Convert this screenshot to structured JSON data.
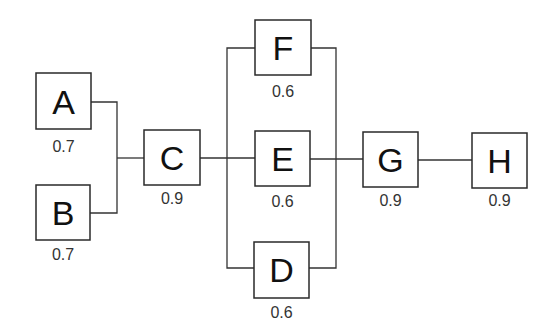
{
  "diagram": {
    "type": "reliability-block-diagram",
    "blocks": [
      {
        "id": "A",
        "label": "A",
        "reliability": "0.7"
      },
      {
        "id": "B",
        "label": "B",
        "reliability": "0.7"
      },
      {
        "id": "C",
        "label": "C",
        "reliability": "0.9"
      },
      {
        "id": "F",
        "label": "F",
        "reliability": "0.6"
      },
      {
        "id": "E",
        "label": "E",
        "reliability": "0.6"
      },
      {
        "id": "D",
        "label": "D",
        "reliability": "0.6"
      },
      {
        "id": "G",
        "label": "G",
        "reliability": "0.9"
      },
      {
        "id": "H",
        "label": "H",
        "reliability": "0.9"
      }
    ],
    "structure": "(A || B) -> C -> (F || E || D) -> G -> H"
  }
}
